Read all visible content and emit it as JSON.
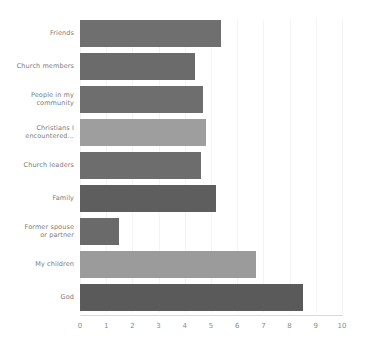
{
  "chart_data": {
    "type": "bar",
    "orientation": "horizontal",
    "title": "",
    "subtitle": "",
    "xlabel": "",
    "ylabel": "",
    "xlim": [
      0,
      10
    ],
    "grid": true,
    "legend": false,
    "categories": [
      "Friends",
      "Church members",
      "People in my community",
      "Christians I encountered...",
      "Church leaders",
      "Family",
      "Former spouse or partner",
      "My children",
      "God"
    ],
    "values": [
      5.4,
      4.4,
      4.7,
      4.8,
      4.6,
      5.2,
      1.5,
      6.7,
      8.5
    ],
    "bar_colors": [
      "#6f6f6f",
      "#6b6b6b",
      "#6e6e6e",
      "#9e9e9e",
      "#6d6d6d",
      "#5e5e5e",
      "#6a6a6a",
      "#9b9b9b",
      "#5a5a5a"
    ],
    "xticks": [
      0,
      1,
      2,
      3,
      4,
      5,
      6,
      7,
      8,
      9,
      10
    ],
    "xtick_labels": [
      "0",
      "1",
      "2",
      "3",
      "4",
      "5",
      "6",
      "7",
      "8",
      "9",
      "10"
    ],
    "label_lines": [
      [
        "Friends"
      ],
      [
        "Church members"
      ],
      [
        "People in my",
        "community"
      ],
      [
        "Christians I",
        "encountered..."
      ],
      [
        "Church leaders"
      ],
      [
        "Family"
      ],
      [
        "Former spouse",
        "or partner"
      ],
      [
        "My children"
      ],
      [
        "God"
      ]
    ],
    "axis_color": "#d8d8d8",
    "gridline_color": "#f4f4f4",
    "tick_label_color": "#8a8a8a",
    "category_label_color": "#7b7b7b",
    "background_color": "#ffffff"
  }
}
